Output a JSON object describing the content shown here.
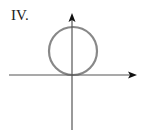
{
  "figure": {
    "label": "IV.",
    "axes": {
      "origin": {
        "x": 72,
        "y": 75
      },
      "x_axis": {
        "from": 9,
        "to": 136,
        "arrow": "right"
      },
      "y_axis": {
        "from": 130,
        "to": 13,
        "arrow": "up"
      },
      "color": "#555555"
    },
    "circle": {
      "cx": 73,
      "cy": 51,
      "r": 24,
      "color": "#888888",
      "description": "circle tangent to x-axis at origin, lying above it"
    }
  }
}
